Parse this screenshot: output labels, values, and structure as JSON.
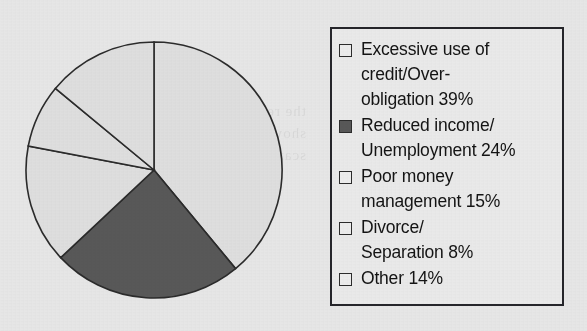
{
  "chart_data": {
    "type": "pie",
    "title": "",
    "subtitle": "",
    "xlabel": "",
    "ylabel": "",
    "legend_position": "right",
    "grid": false,
    "start_angle_deg": 0,
    "direction": "clockwise",
    "total_percent": 100,
    "categories": [
      "Excessive use of credit/Over-obligation",
      "Reduced income/Unemployment",
      "Poor money management",
      "Divorce/Separation",
      "Other"
    ],
    "values": [
      39,
      24,
      15,
      8,
      14
    ],
    "value_unit": "%",
    "slices": [
      {
        "label": "Excessive use of credit/Over-obligation",
        "value": 39,
        "display": "Excessive use of credit/Over-obligation 39%",
        "color": "#dedede",
        "filled": false,
        "start_deg": 0,
        "end_deg": 140.4
      },
      {
        "label": "Reduced income/Unemployment",
        "value": 24,
        "display": "Reduced income/Unemployment 24%",
        "color": "#585858",
        "filled": true,
        "start_deg": 140.4,
        "end_deg": 226.8
      },
      {
        "label": "Poor money management",
        "value": 15,
        "display": "Poor money management 15%",
        "color": "#dedede",
        "filled": false,
        "start_deg": 226.8,
        "end_deg": 280.8
      },
      {
        "label": "Divorce/Separation",
        "value": 8,
        "display": "Divorce/Separation 8%",
        "color": "#dedede",
        "filled": false,
        "start_deg": 280.8,
        "end_deg": 309.6
      },
      {
        "label": "Other",
        "value": 14,
        "display": "Other 14%",
        "color": "#dedede",
        "filled": false,
        "start_deg": 309.6,
        "end_deg": 360
      }
    ]
  },
  "legend": {
    "items": [
      {
        "label": "Excessive use of\ncredit/Over-\nobligation 39%",
        "swatch_icon": "legend-swatch-empty-icon",
        "color": "#ececec",
        "filled": false
      },
      {
        "label": "Reduced income/\nUnemployment 24%",
        "swatch_icon": "legend-swatch-filled-icon",
        "color": "#585858",
        "filled": true
      },
      {
        "label": "Poor money\nmanagement 15%",
        "swatch_icon": "legend-swatch-empty-icon",
        "color": "#ececec",
        "filled": false
      },
      {
        "label": "Divorce/\nSeparation 8%",
        "swatch_icon": "legend-swatch-empty-icon",
        "color": "#ececec",
        "filled": false
      },
      {
        "label": "Other 14%",
        "swatch_icon": "legend-swatch-empty-icon",
        "color": "#ececec",
        "filled": false
      }
    ]
  },
  "colors": {
    "page_background": "#e6e6e6",
    "slice_light": "#dedede",
    "slice_dark": "#585858",
    "outline": "#2b2b2b",
    "legend_background": "#e9e9e9",
    "legend_border": "#25252a",
    "text": "#141414"
  },
  "artifacts": {
    "bleed_through_text": "the reverse page\nshows faintly here\nscanned paper"
  }
}
